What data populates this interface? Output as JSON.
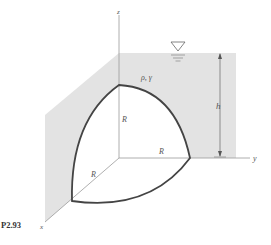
{
  "figure": {
    "id": "P2.93",
    "fluid_label": "ρ, γ",
    "depth_label": "h",
    "radius_labels": [
      "R",
      "R",
      "R"
    ],
    "axes": {
      "x": "x",
      "y": "y",
      "z": "z"
    },
    "free_surface_symbol": "∇",
    "colors": {
      "fluid_fill": "#e3e3e3",
      "curve": "#444444",
      "axis": "#9a9a9a",
      "text": "#555555"
    }
  }
}
